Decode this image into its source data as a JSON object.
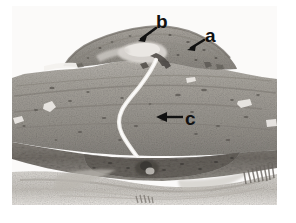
{
  "figure": {
    "type": "histology-micrograph",
    "stain_appearance": "grayscale halftone print",
    "background_color": "#ffffff",
    "image_bounds": {
      "left": 12,
      "top": 6,
      "right": 277,
      "bottom": 205
    }
  },
  "annotations": [
    {
      "id": "a",
      "label": "a",
      "label_x": 205,
      "label_y": 26,
      "arrow": {
        "from_x": 203,
        "from_y": 41,
        "to_x": 189,
        "to_y": 49,
        "direction": "down-left"
      },
      "points_to": "right shoulder margin of the raised plaque"
    },
    {
      "id": "b",
      "label": "b",
      "label_x": 156,
      "label_y": 12,
      "arrow": {
        "from_x": 155,
        "from_y": 29,
        "to_x": 139,
        "to_y": 40,
        "direction": "down-left"
      },
      "points_to": "pale core region at the apex of the plaque"
    },
    {
      "id": "c",
      "label": "c",
      "label_x": 185,
      "label_y": 109,
      "arrow": {
        "from_x": 183,
        "from_y": 117,
        "to_x": 157,
        "to_y": 117,
        "direction": "left"
      },
      "points_to": "mid-stromal tissue band"
    }
  ],
  "colors": {
    "label_text": "#111111",
    "arrow": "#111111",
    "page_background": "#ffffff",
    "tissue_mid_gray": "#9a968f",
    "tissue_dark_gray": "#6d6862",
    "tissue_light_gray": "#c9c5bf",
    "cleft_highlight": "#f2f0ec"
  }
}
